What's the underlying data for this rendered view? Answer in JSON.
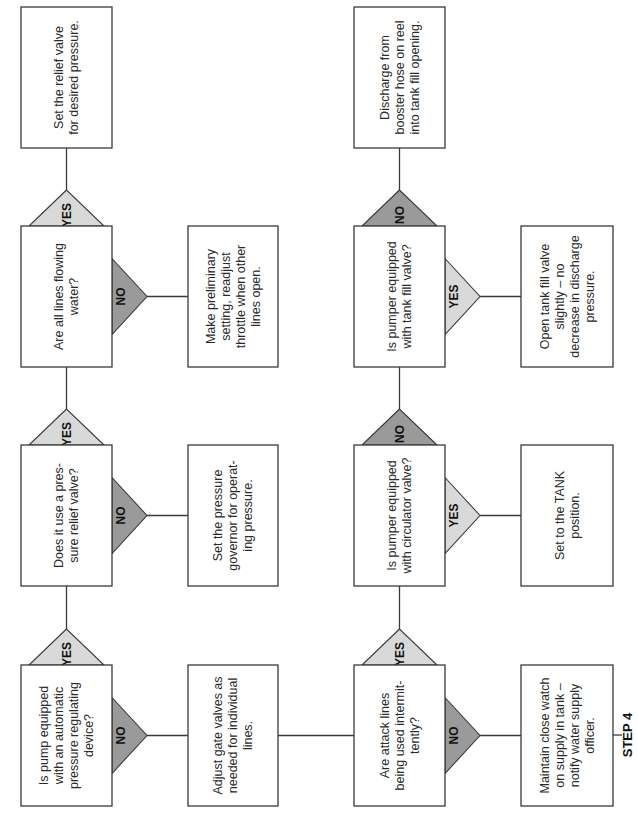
{
  "figure": {
    "step_label": "STEP 4",
    "branch_labels": {
      "yes": "YES",
      "no": "NO"
    },
    "colors": {
      "yes_fill": "#d9d9d9",
      "no_fill": "#9a9a9a",
      "stroke": "#3a3a3a"
    },
    "left_column": {
      "main": [
        {
          "id": "set-relief-valve",
          "type": "action",
          "lines": [
            "Set the relief valve",
            "for desired pressure."
          ]
        },
        {
          "id": "all-lines-flowing",
          "type": "decision",
          "lines": [
            "Are all lines flowing",
            "water?"
          ],
          "top_branch": "yes",
          "side_branch": "no"
        },
        {
          "id": "pressure-relief-valve",
          "type": "decision",
          "lines": [
            "Does it use a pres-",
            "sure relief valve?"
          ],
          "top_branch": "yes",
          "side_branch": "no"
        },
        {
          "id": "automatic-regulating-device",
          "type": "decision",
          "lines": [
            "Is pump equipped",
            "with an automatic",
            "pressure regulating",
            "device?"
          ],
          "top_branch": "yes",
          "side_branch": "no"
        }
      ],
      "side": [
        null,
        {
          "id": "preliminary-setting",
          "type": "action",
          "lines": [
            "Make preliminary",
            "setting, readjust",
            "throttle when other",
            "lines open."
          ]
        },
        {
          "id": "set-pressure-governor",
          "type": "action",
          "lines": [
            "Set the pressure",
            "governor for operat-",
            "ing pressure."
          ]
        },
        {
          "id": "adjust-gate-valves",
          "type": "action",
          "lines": [
            "Adjust gate valves as",
            "needed for individual",
            "lines."
          ]
        }
      ]
    },
    "right_column": {
      "main": [
        {
          "id": "discharge-booster-hose",
          "type": "action",
          "lines": [
            "Discharge from",
            "booster hose on reel",
            "into tank fill opening."
          ]
        },
        {
          "id": "tank-fill-valve",
          "type": "decision",
          "lines": [
            "Is pumper equipped",
            "with tank fill valve?"
          ],
          "top_branch": "no",
          "side_branch": "yes"
        },
        {
          "id": "circulator-valve",
          "type": "decision",
          "lines": [
            "Is pumper equipped",
            "with circulator valve?"
          ],
          "top_branch": "no",
          "side_branch": "yes"
        },
        {
          "id": "attack-lines-intermittent",
          "type": "decision",
          "lines": [
            "Are attack lines",
            "being used intermit-",
            "tently?"
          ],
          "top_branch": "yes",
          "side_branch": "no"
        }
      ],
      "side": [
        null,
        {
          "id": "open-tank-fill-valve",
          "type": "action",
          "lines": [
            "Open tank fill valve",
            "slightly – no",
            "decrease in discharge",
            "pressure."
          ]
        },
        {
          "id": "set-tank-position",
          "type": "action",
          "lines": [
            "Set to the TANK",
            "position."
          ]
        },
        {
          "id": "maintain-close-watch",
          "type": "action",
          "lines": [
            "Maintain close watch",
            "on supply in tank –",
            "notify water supply",
            "officer."
          ]
        }
      ]
    }
  }
}
